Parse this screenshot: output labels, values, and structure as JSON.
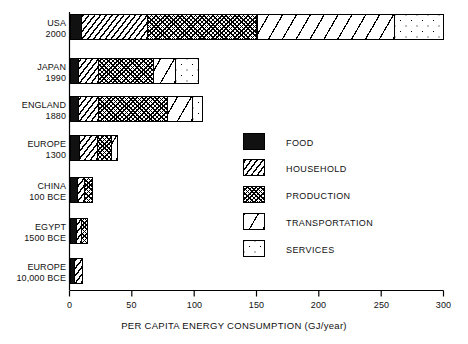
{
  "chart_data": {
    "type": "bar",
    "orientation": "horizontal",
    "stacked": true,
    "title": "",
    "xlabel": "PER CAPITA ENERGY CONSUMPTION (GJ/year)",
    "ylabel": "",
    "xlim": [
      0,
      300
    ],
    "xticks": [
      0,
      50,
      100,
      150,
      200,
      250,
      300
    ],
    "xtick_labels": [
      "0",
      "50",
      "100",
      "150",
      "200",
      "250",
      "300"
    ],
    "grid": false,
    "legend_position": "center-right",
    "categories": [
      {
        "name": "USA",
        "year": "2000"
      },
      {
        "name": "JAPAN",
        "year": "1990"
      },
      {
        "name": "ENGLAND",
        "year": "1880"
      },
      {
        "name": "EUROPE",
        "year": "1300"
      },
      {
        "name": "CHINA",
        "year": "100 BCE"
      },
      {
        "name": "EGYPT",
        "year": "1500 BCE"
      },
      {
        "name": "EUROPE",
        "year": "10,000 BCE"
      }
    ],
    "series": [
      {
        "name": "FOOD",
        "pattern": "solid-black",
        "values": [
          9,
          7,
          7,
          8,
          6,
          5,
          4
        ]
      },
      {
        "name": "HOUSEHOLD",
        "pattern": "diagonal-lines",
        "values": [
          53,
          16,
          16,
          14,
          6,
          4,
          6
        ]
      },
      {
        "name": "PRODUCTION",
        "pattern": "cross-hatch",
        "values": [
          88,
          44,
          55,
          11,
          6,
          5,
          0
        ]
      },
      {
        "name": "TRANSPORTATION",
        "pattern": "wide-diagonal",
        "values": [
          110,
          18,
          20,
          5,
          0,
          0,
          0
        ]
      },
      {
        "name": "SERVICES",
        "pattern": "dots",
        "values": [
          40,
          18,
          8,
          0,
          0,
          0,
          0
        ]
      }
    ],
    "totals": [
      300,
      103,
      106,
      38,
      18,
      14,
      10
    ]
  },
  "legend": {
    "items": [
      {
        "label": "FOOD"
      },
      {
        "label": "HOUSEHOLD"
      },
      {
        "label": "PRODUCTION"
      },
      {
        "label": "TRANSPORTATION"
      },
      {
        "label": "SERVICES"
      }
    ]
  }
}
